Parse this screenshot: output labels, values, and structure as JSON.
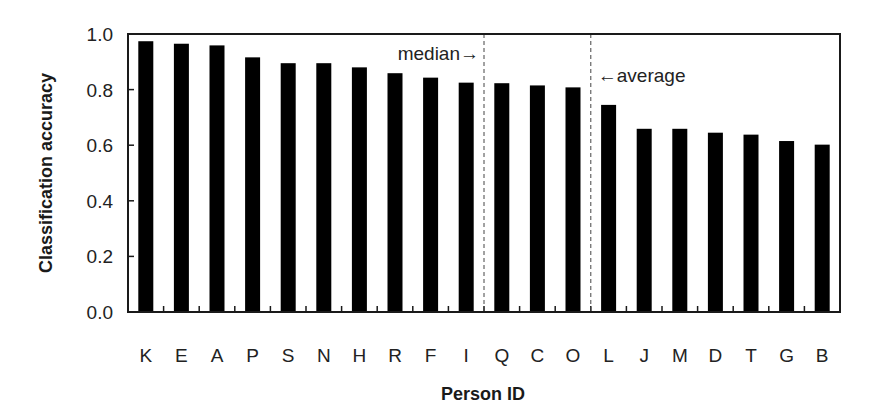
{
  "chart_data": {
    "type": "bar",
    "title": "",
    "xlabel": "Person ID",
    "ylabel": "Classification accuracy",
    "ylim": [
      0.0,
      1.0
    ],
    "yticks": [
      "0.0",
      "0.2",
      "0.4",
      "0.6",
      "0.8",
      "1.0"
    ],
    "grid": false,
    "legend": null,
    "categories": [
      "K",
      "E",
      "A",
      "P",
      "S",
      "N",
      "H",
      "R",
      "F",
      "I",
      "Q",
      "C",
      "O",
      "L",
      "J",
      "M",
      "D",
      "T",
      "G",
      "B"
    ],
    "values": [
      0.974,
      0.965,
      0.959,
      0.916,
      0.895,
      0.895,
      0.88,
      0.859,
      0.843,
      0.825,
      0.823,
      0.815,
      0.808,
      0.745,
      0.659,
      0.659,
      0.645,
      0.638,
      0.615,
      0.602
    ],
    "bar_color": "#000000",
    "annotations": [
      {
        "label": "median→",
        "type": "vertical-dashed-line",
        "position_between": [
          "I",
          "Q"
        ]
      },
      {
        "label": "←average",
        "type": "vertical-dashed-line",
        "position_between": [
          "O",
          "L"
        ]
      }
    ]
  }
}
